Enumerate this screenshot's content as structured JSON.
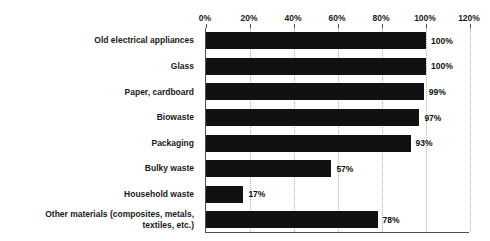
{
  "chart_data": {
    "type": "bar",
    "orientation": "horizontal",
    "title": "",
    "xlabel": "",
    "ylabel": "",
    "xlim": [
      0,
      120
    ],
    "grid": true,
    "legend": null,
    "xticks": [
      "0%",
      "20%",
      "40%",
      "60%",
      "80%",
      "100%",
      "120%"
    ],
    "xtick_values": [
      0,
      20,
      40,
      60,
      80,
      100,
      120
    ],
    "categories": [
      "Old electrical appliances",
      "Glass",
      "Paper, cardboard",
      "Biowaste",
      "Packaging",
      "Bulky waste",
      "Household waste",
      "Other materials (composites, metals, textiles, etc.)"
    ],
    "values": [
      100,
      100,
      99,
      97,
      93,
      57,
      17,
      78
    ],
    "value_labels": [
      "100%",
      "100%",
      "99%",
      "97%",
      "93%",
      "57%",
      "17%",
      "78%"
    ],
    "bar_color": "#111111",
    "gridline_color": "#b0b0b0",
    "axis_color": "#4d4d4d"
  },
  "category_lines": [
    [
      "Old electrical appliances"
    ],
    [
      "Glass"
    ],
    [
      "Paper, cardboard"
    ],
    [
      "Biowaste"
    ],
    [
      "Packaging"
    ],
    [
      "Bulky waste"
    ],
    [
      "Household waste"
    ],
    [
      "Other materials (composites, metals,",
      "textiles, etc.)"
    ]
  ]
}
